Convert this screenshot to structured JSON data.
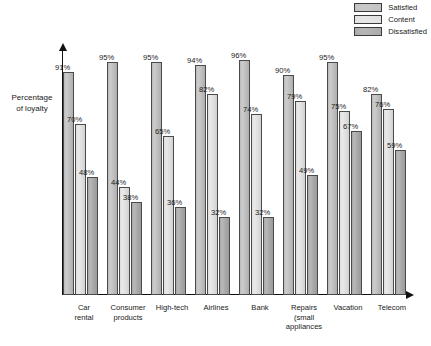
{
  "chart_data": {
    "type": "bar",
    "title": "",
    "subtitle": "",
    "xlabel": "",
    "ylabel": "Percentage of loyalty",
    "ylim": [
      0,
      100
    ],
    "grid": false,
    "legend_position": "top-right",
    "categories": [
      "Car rental",
      "Consumer products",
      "High-tech",
      "Airlines",
      "Bank",
      "Repairs (small appliances",
      "Vacation",
      "Telecom"
    ],
    "category_lines": [
      [
        "Car",
        "rental"
      ],
      [
        "Consumer",
        "products"
      ],
      [
        "High-tech"
      ],
      [
        "Airlines"
      ],
      [
        "Bank"
      ],
      [
        "Repairs",
        "(small",
        "appliances"
      ],
      [
        "Vacation"
      ],
      [
        "Telecom"
      ]
    ],
    "series": [
      {
        "name": "Satisfied",
        "color": "#c2c2c2",
        "values": [
          91,
          95,
          95,
          94,
          96,
          90,
          95,
          82
        ],
        "labels": [
          "91%",
          "95%",
          "95%",
          "94%",
          "96%",
          "90%",
          "95%",
          "82%"
        ]
      },
      {
        "name": "Content",
        "color": "#e2e2e2",
        "values": [
          70,
          44,
          65,
          82,
          74,
          79,
          75,
          76
        ],
        "labels": [
          "70%",
          "44%",
          "65%",
          "82%",
          "74%",
          "79%",
          "75%",
          "76%"
        ]
      },
      {
        "name": "Dissatisfied",
        "color": "#ababab",
        "values": [
          48,
          38,
          36,
          32,
          32,
          49,
          67,
          59
        ],
        "labels": [
          "48%",
          "38%",
          "36%",
          "32%",
          "32%",
          "49%",
          "67%",
          "59%"
        ]
      }
    ]
  },
  "legend": {
    "items": [
      {
        "label": "Satisfied",
        "color": "#c2c2c2"
      },
      {
        "label": "Content",
        "color": "#e2e2e2"
      },
      {
        "label": "Dissatisfied",
        "color": "#ababab"
      }
    ]
  },
  "axis": {
    "y_label_line1": "Percentage",
    "y_label_line2": "of loyalty"
  }
}
